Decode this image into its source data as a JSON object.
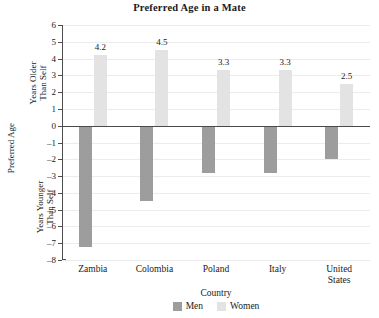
{
  "chart_data": {
    "type": "bar",
    "title": "Preferred Age in a Mate",
    "xlabel": "Country",
    "ylabel": "Preferred Age",
    "ylabel_upper": [
      "Years Older",
      "Than Self"
    ],
    "ylabel_lower": [
      "Years Younger",
      "Than Self"
    ],
    "categories": [
      "Zambia",
      "Colombia",
      "Poland",
      "Italy",
      "United States"
    ],
    "category_lines": [
      [
        "Zambia"
      ],
      [
        "Colombia"
      ],
      [
        "Poland"
      ],
      [
        "Italy"
      ],
      [
        "United",
        "States"
      ]
    ],
    "series": [
      {
        "name": "Men",
        "color": "#9d9d9d",
        "values": [
          -7.2,
          -4.5,
          -2.8,
          -2.8,
          -2.0
        ]
      },
      {
        "name": "Women",
        "color": "#e3e3e3",
        "values": [
          4.2,
          4.5,
          3.3,
          3.3,
          2.5
        ]
      }
    ],
    "value_labels": [
      "4.2",
      "4.5",
      "3.3",
      "3.3",
      "2.5"
    ],
    "ylim": [
      -8,
      6
    ],
    "yticks": [
      6,
      5,
      4,
      3,
      2,
      1,
      0,
      -1,
      -2,
      -3,
      -4,
      -5,
      -6,
      -7,
      -8
    ],
    "ytick_labels": [
      "6",
      "5",
      "4",
      "3",
      "2",
      "1",
      "0",
      "–1",
      "–2",
      "–3",
      "–4",
      "–5",
      "–6",
      "–7",
      "–8"
    ],
    "grid": true,
    "legend_position": "bottom",
    "zero_line": true
  },
  "legend": {
    "men_label": "Men",
    "women_label": "Women"
  }
}
